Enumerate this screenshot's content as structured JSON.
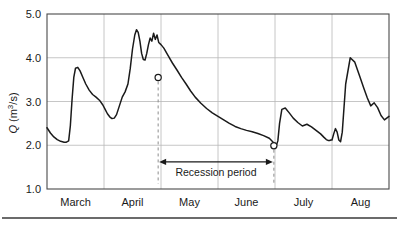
{
  "chart_data": {
    "type": "line",
    "title": "",
    "subtitle": "",
    "xlabel": "",
    "ylabel": "Q (m3/s)",
    "ylabel_parts": {
      "symbol": "Q",
      "open": " (m",
      "exponent": "3",
      "close": "/s)"
    },
    "grid": true,
    "legend": "none",
    "xlim": [
      0,
      6
    ],
    "ylim": [
      1.0,
      5.0
    ],
    "yticks": [
      "1.0",
      "2.0",
      "3.0",
      "4.0",
      "5.0"
    ],
    "ytick_values": [
      1.0,
      2.0,
      3.0,
      4.0,
      5.0
    ],
    "categories": [
      "March",
      "April",
      "May",
      "June",
      "July",
      "Aug"
    ],
    "xtick_boundaries": [
      0,
      1,
      2,
      3,
      4,
      5,
      6
    ],
    "series": [
      {
        "name": "Discharge",
        "x": [
          0.0,
          0.06,
          0.12,
          0.18,
          0.24,
          0.3,
          0.34,
          0.38,
          0.41,
          0.44,
          0.47,
          0.5,
          0.54,
          0.58,
          0.63,
          0.68,
          0.74,
          0.8,
          0.86,
          0.92,
          0.98,
          1.02,
          1.06,
          1.1,
          1.14,
          1.18,
          1.22,
          1.27,
          1.32,
          1.37,
          1.42,
          1.46,
          1.5,
          1.54,
          1.57,
          1.6,
          1.63,
          1.66,
          1.69,
          1.72,
          1.75,
          1.78,
          1.81,
          1.84,
          1.87,
          1.9,
          1.93,
          1.96,
          2.0,
          2.05,
          2.12,
          2.2,
          2.28,
          2.36,
          2.44,
          2.52,
          2.6,
          2.7,
          2.8,
          2.9,
          3.0,
          3.1,
          3.2,
          3.3,
          3.4,
          3.5,
          3.6,
          3.7,
          3.8,
          3.9,
          3.96,
          4.0,
          4.02,
          4.05,
          4.08,
          4.12,
          4.18,
          4.25,
          4.32,
          4.4,
          4.48,
          4.56,
          4.64,
          4.72,
          4.8,
          4.86,
          4.9,
          4.93,
          4.96,
          4.98,
          5.0,
          5.03,
          5.06,
          5.09,
          5.12,
          5.15,
          5.18,
          5.24,
          5.32,
          5.4,
          5.48,
          5.56,
          5.62,
          5.68,
          5.74,
          5.8,
          5.86,
          5.92,
          6.0
        ],
        "y": [
          2.4,
          2.28,
          2.19,
          2.13,
          2.09,
          2.07,
          2.07,
          2.1,
          2.45,
          3.05,
          3.55,
          3.76,
          3.78,
          3.7,
          3.55,
          3.4,
          3.26,
          3.16,
          3.1,
          3.03,
          2.92,
          2.82,
          2.72,
          2.65,
          2.61,
          2.62,
          2.7,
          2.9,
          3.1,
          3.22,
          3.4,
          3.75,
          4.2,
          4.52,
          4.64,
          4.58,
          4.38,
          4.1,
          3.96,
          3.95,
          4.1,
          4.3,
          4.45,
          4.38,
          4.56,
          4.42,
          4.52,
          4.35,
          4.3,
          4.22,
          4.06,
          3.88,
          3.72,
          3.55,
          3.4,
          3.24,
          3.1,
          2.96,
          2.84,
          2.74,
          2.66,
          2.58,
          2.5,
          2.43,
          2.38,
          2.34,
          2.31,
          2.27,
          2.22,
          2.16,
          2.08,
          2.0,
          1.98,
          2.1,
          2.5,
          2.82,
          2.85,
          2.74,
          2.62,
          2.52,
          2.44,
          2.48,
          2.42,
          2.34,
          2.26,
          2.18,
          2.13,
          2.11,
          2.11,
          2.12,
          2.12,
          2.26,
          2.38,
          2.3,
          2.12,
          2.08,
          2.3,
          3.4,
          4.0,
          3.9,
          3.6,
          3.3,
          3.08,
          2.9,
          2.97,
          2.86,
          2.68,
          2.58,
          2.66
        ]
      }
    ],
    "markers": [
      {
        "label": "recession-start",
        "x": 1.95,
        "y": 3.55
      },
      {
        "label": "recession-end",
        "x": 3.98,
        "y": 1.99
      }
    ],
    "annotations": [
      {
        "label": "Recession period",
        "x_start": 1.95,
        "x_end": 3.98,
        "y": 1.62
      }
    ],
    "colors": {
      "line": "#1a1a1a",
      "grid": "#b8b8b8",
      "frame": "#4a4a4a",
      "leader": "#8d8d8d",
      "background": "#ffffff"
    }
  }
}
